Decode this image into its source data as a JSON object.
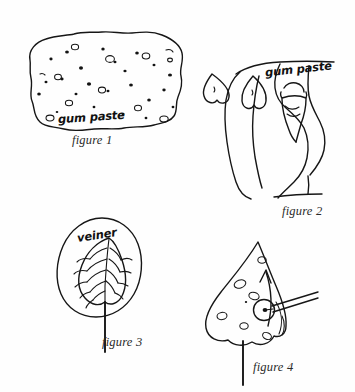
{
  "page": {
    "background_color": "#fefefe",
    "ink_color": "#161616",
    "width": 355,
    "height": 392
  },
  "figures": [
    {
      "id": "figure-1",
      "caption": "figure 1",
      "label": "gum paste",
      "subject": "speckled slab of gum paste",
      "icon": "gum-paste-slab-icon"
    },
    {
      "id": "figure-2",
      "caption": "figure 2",
      "label": "gum paste",
      "subject": "hand pinching gum paste into a cone between fingers",
      "icon": "hand-shaping-gum-paste-icon"
    },
    {
      "id": "figure-3",
      "caption": "figure 3",
      "label": "veiner",
      "subject": "leaf veiner mold pressed on a shaped leaf with stem wire",
      "icon": "leaf-veiner-icon"
    },
    {
      "id": "figure-4",
      "caption": "figure 4",
      "label": "",
      "subject": "teardrop petal on a wire with modelling tool and curl arrow",
      "icon": "petal-tool-curl-icon"
    }
  ]
}
